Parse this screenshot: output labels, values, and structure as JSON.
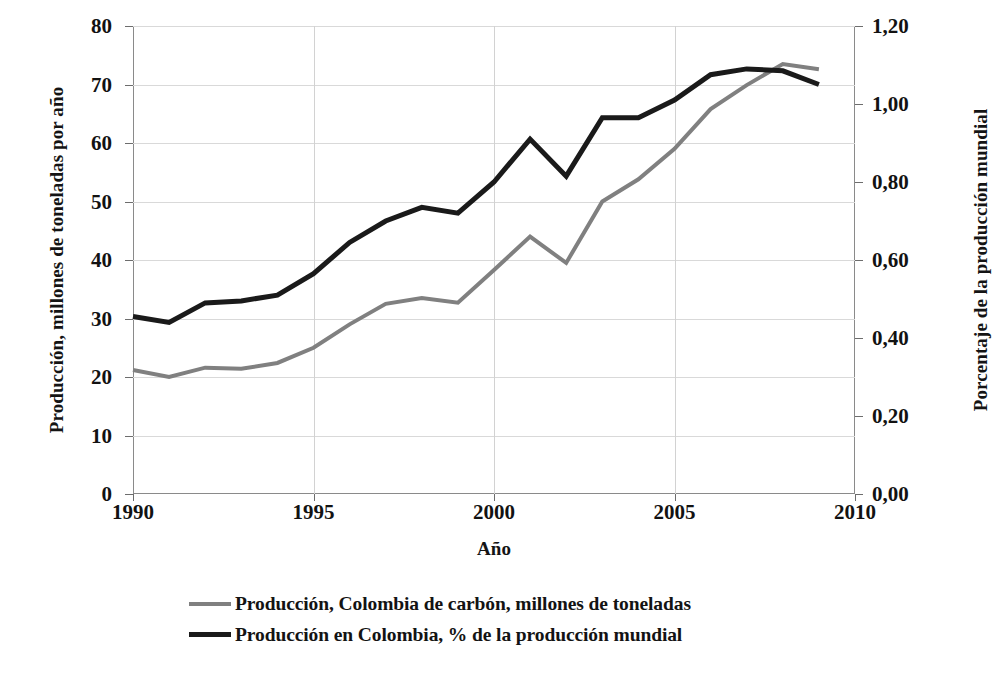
{
  "chart_data": {
    "type": "line",
    "title": "",
    "xlabel": "Año",
    "ylabel": "Producción, millones de toneladas por año",
    "ylabel_right": "Porcentaje de la producción mundial",
    "x": [
      1990,
      1991,
      1992,
      1993,
      1994,
      1995,
      1996,
      1997,
      1998,
      1999,
      2000,
      2001,
      2002,
      2003,
      2004,
      2005,
      2006,
      2007,
      2008,
      2009
    ],
    "xlim": [
      1990,
      2010
    ],
    "xticks": [
      1990,
      1995,
      2000,
      2005,
      2010
    ],
    "xtick_labels": [
      "1990",
      "1995",
      "2000",
      "2005",
      "2010"
    ],
    "ylim": [
      0,
      80
    ],
    "yticks": [
      0,
      10,
      20,
      30,
      40,
      50,
      60,
      70,
      80
    ],
    "ytick_labels": [
      "0",
      "10",
      "20",
      "30",
      "40",
      "50",
      "60",
      "70",
      "80"
    ],
    "ylim_right": [
      0,
      1.2
    ],
    "yticks_right": [
      0,
      0.2,
      0.4,
      0.6,
      0.8,
      1.0,
      1.2
    ],
    "ytick_labels_right": [
      "0,00",
      "0,20",
      "0,40",
      "0,60",
      "0,80",
      "1,00",
      "1,20"
    ],
    "grid": true,
    "legend_position": "bottom",
    "series": [
      {
        "name": "Producción, Colombia de carbón,  millones de toneladas",
        "axis": "left",
        "color": "#808080",
        "width": 4,
        "values": [
          21.2,
          20.0,
          21.6,
          21.4,
          22.4,
          25.0,
          29.0,
          32.5,
          33.5,
          32.7,
          38.3,
          44.0,
          39.5,
          50.0,
          53.8,
          59.0,
          65.8,
          69.9,
          73.5,
          72.6
        ]
      },
      {
        "name": "Producción  en Colombia, % de la producción mundial",
        "axis": "right",
        "color": "#1a1a1a",
        "width": 5,
        "values": [
          0.455,
          0.44,
          0.49,
          0.495,
          0.51,
          0.565,
          0.645,
          0.7,
          0.735,
          0.72,
          0.8,
          0.91,
          0.815,
          0.965,
          0.965,
          1.01,
          1.075,
          1.09,
          1.085,
          1.05
        ]
      }
    ]
  },
  "legend": {
    "items": [
      {
        "label": "Producción, Colombia de carbón,  millones de toneladas",
        "color": "#808080",
        "swatch": "series-gray"
      },
      {
        "label": "Producción  en Colombia, % de la producción mundial",
        "color": "#1a1a1a",
        "swatch": "series-black"
      }
    ]
  }
}
